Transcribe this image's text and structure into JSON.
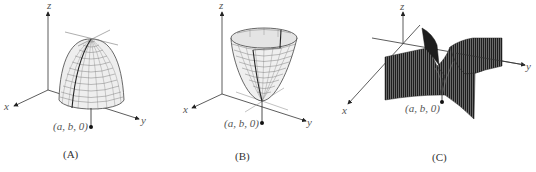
{
  "figure": {
    "panels": [
      {
        "id": "A",
        "caption": "(A)",
        "surface": "downward paraboloid (local maximum)",
        "axes": {
          "x": "x",
          "y": "y",
          "z": "z"
        },
        "point_label": "(a, b, 0)"
      },
      {
        "id": "B",
        "caption": "(B)",
        "surface": "upward paraboloid (local minimum)",
        "axes": {
          "x": "x",
          "y": "y",
          "z": "z"
        },
        "point_label": "(a, b, 0)"
      },
      {
        "id": "C",
        "caption": "(C)",
        "surface": "saddle surface (saddle point)",
        "axes": {
          "x": "x",
          "y": "y",
          "z": "z"
        },
        "point_label": "(a, b, 0)"
      }
    ],
    "colors": {
      "axis": "#333333",
      "mesh": "#555555",
      "surface_fill": "#e8e8e8",
      "saddle_dark": "#3a3a3a"
    }
  }
}
